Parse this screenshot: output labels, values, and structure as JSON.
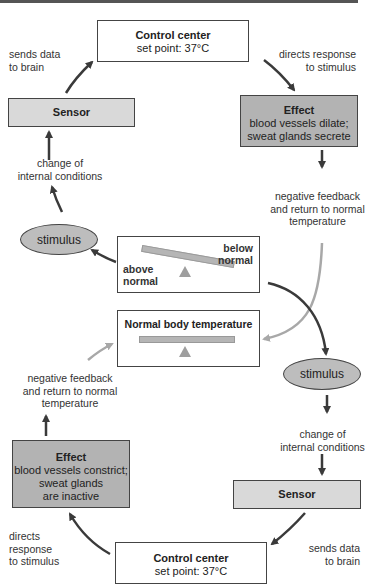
{
  "title_rule": true,
  "top_loop": {
    "control_center": {
      "title": "Control center",
      "subtitle": "set point: 37°C"
    },
    "sensor": {
      "label": "Sensor"
    },
    "effect": {
      "title": "Effect",
      "line1": "blood vessels dilate;",
      "line2": "sweat glands secrete"
    },
    "sends_data": {
      "line1": "sends data",
      "line2": "to brain"
    },
    "directs_response": {
      "line1": "directs response",
      "line2": "to stimulus"
    },
    "change_conditions": {
      "line1": "change of",
      "line2": "internal conditions"
    },
    "stimulus": {
      "label": "stimulus"
    },
    "negative_feedback": {
      "line1": "negative feedback",
      "line2": "and return to normal",
      "line3": "temperature"
    }
  },
  "seesaw": {
    "imbalanced": {
      "below": {
        "line1": "below",
        "line2": "normal"
      },
      "above": {
        "line1": "above",
        "line2": "normal"
      }
    },
    "normal": {
      "title": "Normal body temperature"
    }
  },
  "bottom_loop": {
    "negative_feedback": {
      "line1": "negative feedback",
      "line2": "and return to normal",
      "line3": "temperature"
    },
    "stimulus": {
      "label": "stimulus"
    },
    "change_conditions": {
      "line1": "change of",
      "line2": "internal conditions"
    },
    "effect": {
      "title": "Effect",
      "line1": "blood vessels constrict;",
      "line2": "sweat glands",
      "line3": "are inactive"
    },
    "sensor": {
      "label": "Sensor"
    },
    "directs_response": {
      "line1": "directs",
      "line2": "response",
      "line3": "to stimulus"
    },
    "sends_data": {
      "line1": "sends data",
      "line2": "to brain"
    },
    "control_center": {
      "title": "Control center",
      "subtitle": "set point: 37°C"
    }
  },
  "colors": {
    "arrow_dark": "#3a3a3a",
    "arrow_light": "#a8a8a8",
    "box_light": "#d9d9d9",
    "box_dark": "#b3b3b3",
    "ellipse": "#bdbdbd"
  }
}
